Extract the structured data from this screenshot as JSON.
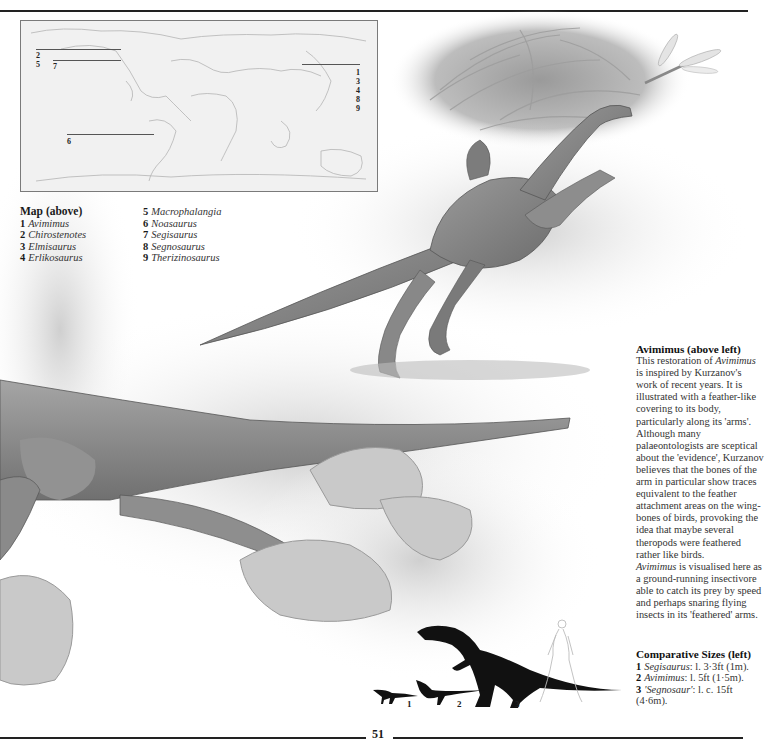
{
  "page": {
    "number": "51"
  },
  "map": {
    "title": "Map (above)",
    "labels_left_top": [
      "2"
    ],
    "labels_left_second": [
      "5",
      "7"
    ],
    "labels_bottom": [
      "6"
    ],
    "labels_right": [
      "1",
      "3",
      "4",
      "8",
      "9"
    ],
    "legend_col1": [
      {
        "num": "1",
        "name": "Avimimus"
      },
      {
        "num": "2",
        "name": "Chirostenotes"
      },
      {
        "num": "3",
        "name": "Elmisaurus"
      },
      {
        "num": "4",
        "name": "Erlikosaurus"
      }
    ],
    "legend_col2": [
      {
        "num": "5",
        "name": "Macrophalangia"
      },
      {
        "num": "6",
        "name": "Noasaurus"
      },
      {
        "num": "7",
        "name": "Segisaurus"
      },
      {
        "num": "8",
        "name": "Segnosaurus"
      },
      {
        "num": "9",
        "name": "Therizinosaurus"
      }
    ]
  },
  "caption": {
    "heading": "Avimimus (above left)",
    "p1_pre": "This restoration of ",
    "p1_italic": "Avimimus",
    "p1_post": " is inspired by Kurzanov's work of recent years. It is illustrated with a feather-like covering to its body, particularly along its 'arms'. Although many palaeontologists are sceptical about the 'evidence', Kurzanov believes that the bones of the arm in particular show traces equivalent to the feather attachment areas on the wing-bones of birds, provoking the idea that maybe several theropods were feathered rather like birds.",
    "p2_italic": "Avimimus",
    "p2_post": " is visualised here as a ground-running insectivore able to catch its prey by speed and perhaps snaring flying insects in its 'feathered' arms."
  },
  "sizes": {
    "heading": "Comparative Sizes (left)",
    "items": [
      {
        "num": "1",
        "name": "Segisaurus",
        "detail": ": l. 3·3ft (1m)."
      },
      {
        "num": "2",
        "name": "Avimimus",
        "detail": ": l. 5ft (1·5m)."
      },
      {
        "num": "3",
        "name": "'Segnosaur'",
        "detail": ": l. c. 15ft (4·6m)."
      }
    ],
    "silhouette_labels": [
      "1",
      "2",
      "3"
    ]
  },
  "illustration": {
    "subjects": [
      "avimimus-running",
      "dragonfly",
      "fern-foliage",
      "large-theropod-tail-foreground",
      "rocks"
    ],
    "palette": {
      "ink": "#222222",
      "mid": "#8a8a8a",
      "light": "#d6d6d6",
      "paper": "#ffffff"
    }
  }
}
